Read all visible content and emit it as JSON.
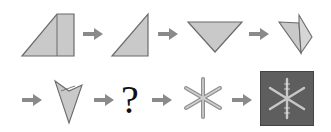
{
  "diagram": {
    "colors": {
      "shape_fill": "#c9c9c9",
      "shape_stroke": "#6b6b6b",
      "arrow": "#8a8a8a",
      "box_bg": "#5e5e5e",
      "snowflake_light": "#d8d8d8"
    },
    "row1": [
      {
        "step": 1,
        "shape": "square-folded-to-trapezoid"
      },
      {
        "step": 2,
        "shape": "right-triangle"
      },
      {
        "step": 3,
        "shape": "inverted-triangle"
      },
      {
        "step": 4,
        "shape": "folded-triangle"
      }
    ],
    "row2": [
      {
        "step": 5,
        "shape": "folded-v-shape"
      },
      {
        "step": 6,
        "shape": "unknown",
        "label": "?"
      },
      {
        "step": 7,
        "shape": "snowflake"
      },
      {
        "step": 8,
        "shape": "snowflake-on-dark-square"
      }
    ],
    "arrow_icon": "right-arrow"
  }
}
